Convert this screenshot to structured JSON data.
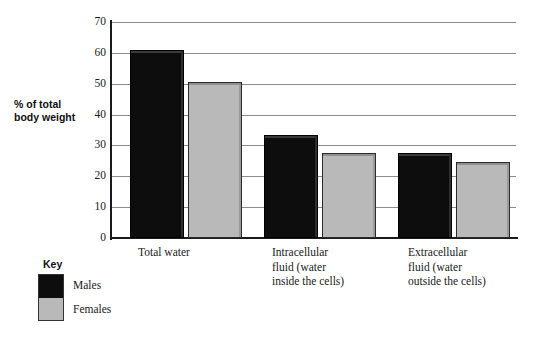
{
  "chart_data": {
    "type": "bar",
    "title": "",
    "subtitle": "",
    "xlabel": "",
    "ylabel": "% of total body weight",
    "ylim": [
      0,
      70
    ],
    "yticks": [
      0,
      10,
      20,
      30,
      40,
      50,
      60,
      70
    ],
    "ytick_labels": [
      "0",
      "10",
      "20",
      "30",
      "40",
      "50",
      "60",
      "70"
    ],
    "grid": true,
    "legend_position": "bottom-left",
    "legend_title": "Key",
    "categories": [
      "Total water",
      "Intracellular fluid (water inside the cells)",
      "Extracellular fluid (water outside the cells)"
    ],
    "category_label_lines": [
      [
        "Total water"
      ],
      [
        "Intracellular",
        "fluid (water",
        "inside the cells)"
      ],
      [
        "Extracellular",
        "fluid  (water",
        "outside the cells)"
      ]
    ],
    "series": [
      {
        "name": "Males",
        "color": "#0d0d0d",
        "values": [
          61,
          33.5,
          27.5
        ]
      },
      {
        "name": "Females",
        "color": "#b9b9b9",
        "values": [
          50.5,
          27.5,
          24.5
        ]
      }
    ]
  },
  "axis": {
    "y_title_lines": [
      "% of total",
      "body weight"
    ]
  },
  "key": {
    "title": "Key",
    "items": [
      {
        "label": "Males",
        "color": "#0d0d0d"
      },
      {
        "label": "Females",
        "color": "#b9b9b9"
      }
    ]
  }
}
